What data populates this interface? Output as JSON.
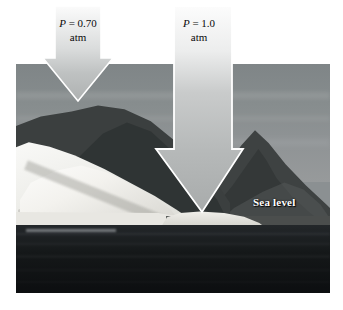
{
  "figure": {
    "background_color": "#ffffff"
  },
  "photo": {
    "alt": "coastal landscape photograph with iceberg, dark mountain ridges, and sea",
    "sky_color": "#8a8f90",
    "land_color": "#3b3f3f",
    "ice_color": "#f2f1ec",
    "sea_color": "#14171a",
    "bounds": {
      "x": 16,
      "y": 64,
      "width": 314,
      "height": 229
    }
  },
  "annotations": {
    "sea_level": {
      "text": "Sea level",
      "color": "#ffffff"
    }
  },
  "arrows": [
    {
      "id": "arrow-left",
      "pressure_symbol": "P",
      "equals": "=",
      "value": "0.70",
      "unit": "atm",
      "label_line1": "P = 0.70",
      "label_line2": "atm",
      "target": "mountain-summit",
      "fill_color": "#b9bcbc",
      "outline_color": "#ffffff"
    },
    {
      "id": "arrow-right",
      "pressure_symbol": "P",
      "equals": "=",
      "value": "1.0",
      "unit": "atm",
      "label_line1": "P = 1.0",
      "label_line2": "atm",
      "target": "sea-level",
      "fill_color": "#b9bcbc",
      "outline_color": "#ffffff"
    }
  ]
}
